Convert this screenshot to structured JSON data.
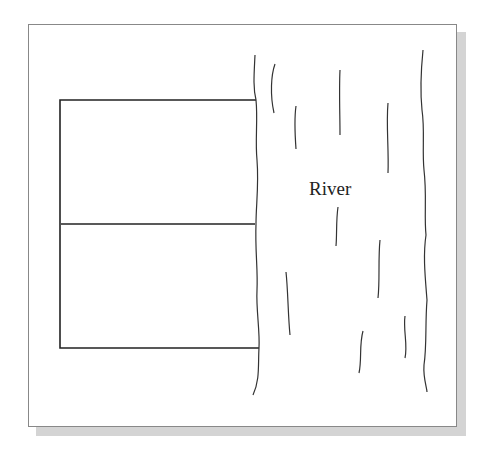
{
  "diagram": {
    "river_label": "River",
    "plot": {
      "left_x": 60,
      "right_x": 256,
      "top_y": 100,
      "middle_y": 224,
      "bottom_y": 348,
      "sections": 2
    },
    "colors": {
      "line": "#222222",
      "frame_border": "#888888",
      "shadow": "#d4d4d4"
    }
  }
}
